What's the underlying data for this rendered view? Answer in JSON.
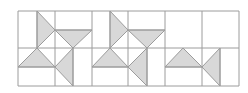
{
  "diagram": {
    "width": 248,
    "height": 93,
    "colors": {
      "background": "#ffffff",
      "line": "#9c9c9c",
      "fill": "#d8d8d8"
    },
    "grid": {
      "x_lines": [
        18,
        55,
        92,
        128,
        165,
        202,
        239
      ],
      "y_lines": [
        11,
        48,
        86
      ]
    },
    "blocks": [
      {
        "name": "block-1",
        "extra_lines": [
          {
            "x1": 37,
            "y1": 11,
            "x2": 37,
            "y2": 48
          },
          {
            "x1": 55,
            "y1": 30,
            "x2": 92,
            "y2": 30
          },
          {
            "x1": 18,
            "y1": 67,
            "x2": 55,
            "y2": 67
          },
          {
            "x1": 73,
            "y1": 48,
            "x2": 73,
            "y2": 86
          }
        ],
        "triangles": [
          {
            "dir": "right",
            "points": "37,11 55,30 37,48"
          },
          {
            "dir": "down",
            "points": "55,30 92,30 73,48"
          },
          {
            "dir": "up",
            "points": "18,67 55,67 37,48"
          },
          {
            "dir": "left",
            "points": "73,48 73,86 55,67"
          }
        ]
      },
      {
        "name": "block-2",
        "extra_lines": [
          {
            "x1": 110,
            "y1": 11,
            "x2": 110,
            "y2": 48
          },
          {
            "x1": 128,
            "y1": 30,
            "x2": 165,
            "y2": 30
          },
          {
            "x1": 92,
            "y1": 67,
            "x2": 128,
            "y2": 67
          },
          {
            "x1": 147,
            "y1": 48,
            "x2": 147,
            "y2": 86
          }
        ],
        "triangles": [
          {
            "dir": "right",
            "points": "110,11 128,30 110,48"
          },
          {
            "dir": "down",
            "points": "128,30 165,30 147,48"
          },
          {
            "dir": "up",
            "points": "92,67 128,67 110,48"
          },
          {
            "dir": "left",
            "points": "147,48 147,86 128,67"
          }
        ]
      },
      {
        "name": "block-3",
        "extra_lines": [
          {
            "x1": 165,
            "y1": 67,
            "x2": 202,
            "y2": 67
          },
          {
            "x1": 220,
            "y1": 48,
            "x2": 220,
            "y2": 86
          }
        ],
        "triangles": [
          {
            "dir": "up",
            "points": "165,67 202,67 183,48"
          },
          {
            "dir": "left",
            "points": "220,48 220,86 202,67"
          }
        ]
      }
    ]
  }
}
